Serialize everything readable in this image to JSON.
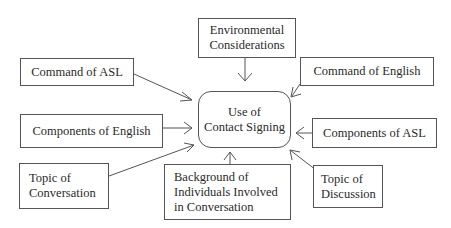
{
  "diagram": {
    "center": {
      "label": "Use of\nContact Signing"
    },
    "factors": [
      {
        "id": "environmental",
        "label": "Environmental\nConsiderations"
      },
      {
        "id": "command-asl",
        "label": "Command of ASL"
      },
      {
        "id": "command-english",
        "label": "Command of English"
      },
      {
        "id": "components-english",
        "label": "Components of English"
      },
      {
        "id": "components-asl",
        "label": "Components of ASL"
      },
      {
        "id": "topic-conversation",
        "label": "Topic of\nConversation"
      },
      {
        "id": "background",
        "label": "Background of\nIndividuals Involved\nin Conversation"
      },
      {
        "id": "topic-discussion",
        "label": "Topic of\nDiscussion"
      }
    ],
    "edges": [
      {
        "from": "environmental",
        "to": "center"
      },
      {
        "from": "command-asl",
        "to": "center"
      },
      {
        "from": "command-english",
        "to": "center"
      },
      {
        "from": "components-english",
        "to": "center"
      },
      {
        "from": "components-asl",
        "to": "center"
      },
      {
        "from": "topic-conversation",
        "to": "center"
      },
      {
        "from": "background",
        "to": "center"
      },
      {
        "from": "topic-discussion",
        "to": "center"
      }
    ]
  }
}
